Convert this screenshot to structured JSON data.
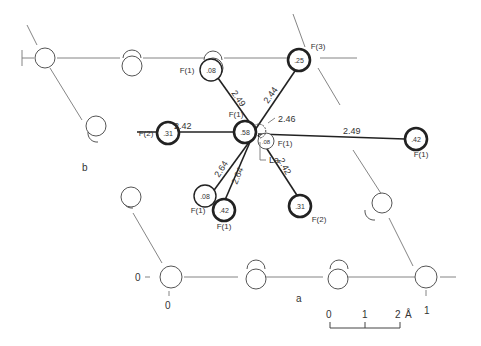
{
  "figure": {
    "axes": {
      "a_label": "a",
      "b_label": "b"
    },
    "cell_corners": {
      "origin": {
        "x_label": "0",
        "y_label": "0"
      },
      "a_end": {
        "label": "1"
      },
      "b_end": {
        "label": "1"
      }
    },
    "scale_bar": {
      "ticks": [
        "0",
        "1",
        "2"
      ],
      "unit": "Å"
    },
    "central_atom": {
      "label": "La"
    },
    "fluorines": [
      {
        "id": "f1_top",
        "label": "F(1)",
        "height": ".08",
        "bond": "2.49"
      },
      {
        "id": "f3_top",
        "label": "F(3)",
        "height": ".25",
        "bond": "2.44"
      },
      {
        "id": "f2_left",
        "label": "F(2)",
        "height": ".31",
        "bond": "2.42"
      },
      {
        "id": "f1_center",
        "label": "F(1)",
        "height": ".58",
        "bond": "2.46"
      },
      {
        "id": "f1_near",
        "label": "F(1)",
        "height": ".08",
        "bond": ""
      },
      {
        "id": "f1_right",
        "label": "F(1)",
        "height": ".42",
        "bond": "2.49"
      },
      {
        "id": "f1_bl",
        "label": "F(1)",
        "height": ".08",
        "bond": "2.64"
      },
      {
        "id": "f1_bm",
        "label": "F(1)",
        "height": ".42",
        "bond": "2.64"
      },
      {
        "id": "f2_br",
        "label": "F(2)",
        "height": ".31",
        "bond": "2.42"
      }
    ]
  }
}
